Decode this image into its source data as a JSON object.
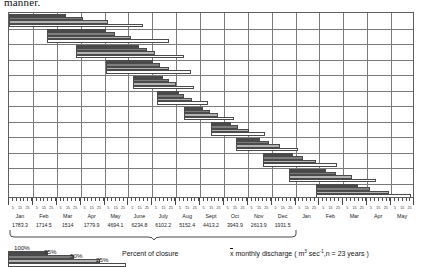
{
  "page": {
    "cut_off_text": "manner."
  },
  "chart_data": {
    "type": "bar",
    "title": "",
    "xlabel": "",
    "ylabel": "",
    "orientation": "horizontal",
    "grid": true,
    "legend_position": "bottom-left",
    "x_axis": {
      "tick_days": [
        5,
        15,
        25
      ],
      "months": [
        "Jan",
        "Feb",
        "Mar",
        "Apr",
        "May",
        "June",
        "July",
        "Aug",
        "Sept",
        "Oct",
        "Nov",
        "Dec",
        "Jan",
        "Feb",
        "Mar",
        "Apr",
        "May"
      ],
      "monthly_discharge": [
        "1783.3",
        "1714.5",
        "1514",
        "1779.9",
        "4694.1",
        "6234.8",
        "6102.2",
        "5152.4",
        "4413.2",
        "3943.9",
        "2613.9",
        "1931.5",
        "",
        "",
        "",
        "",
        ""
      ]
    },
    "series": [
      {
        "name": "100%",
        "shade": "#4a4a4a"
      },
      {
        "name": "75%",
        "shade": "#7d7d7d"
      },
      {
        "name": "50%",
        "shade": "#b3b3b3"
      },
      {
        "name": "25%",
        "shade": "#fdfdfd"
      }
    ],
    "groups": [
      {
        "label": "Jan",
        "start_month": 0,
        "bars": [
          {
            "series": "100%",
            "start": 0.0,
            "end": 0.14
          },
          {
            "series": "75%",
            "start": 0.0,
            "end": 0.182
          },
          {
            "series": "50%",
            "start": 0.0,
            "end": 0.245
          },
          {
            "series": "25%",
            "start": 0.0,
            "end": 0.33
          }
        ]
      },
      {
        "label": "Feb",
        "start_month": 1,
        "bars": [
          {
            "series": "100%",
            "start": 0.094,
            "end": 0.238
          },
          {
            "series": "75%",
            "start": 0.094,
            "end": 0.262
          },
          {
            "series": "50%",
            "start": 0.094,
            "end": 0.3
          },
          {
            "series": "25%",
            "start": 0.094,
            "end": 0.393
          }
        ]
      },
      {
        "label": "Mar",
        "start_month": 2,
        "bars": [
          {
            "series": "100%",
            "start": 0.166,
            "end": 0.32
          },
          {
            "series": "75%",
            "start": 0.166,
            "end": 0.34
          },
          {
            "series": "50%",
            "start": 0.166,
            "end": 0.36
          },
          {
            "series": "25%",
            "start": 0.166,
            "end": 0.43
          }
        ]
      },
      {
        "label": "Apr",
        "start_month": 3,
        "bars": [
          {
            "series": "100%",
            "start": 0.238,
            "end": 0.355
          },
          {
            "series": "75%",
            "start": 0.238,
            "end": 0.371
          },
          {
            "series": "50%",
            "start": 0.238,
            "end": 0.394
          },
          {
            "series": "25%",
            "start": 0.238,
            "end": 0.448
          }
        ]
      },
      {
        "label": "May",
        "start_month": 4,
        "bars": [
          {
            "series": "100%",
            "start": 0.305,
            "end": 0.38
          },
          {
            "series": "75%",
            "start": 0.305,
            "end": 0.394
          },
          {
            "series": "50%",
            "start": 0.305,
            "end": 0.412
          },
          {
            "series": "25%",
            "start": 0.305,
            "end": 0.455
          }
        ]
      },
      {
        "label": "June",
        "start_month": 5,
        "bars": [
          {
            "series": "100%",
            "start": 0.365,
            "end": 0.418
          },
          {
            "series": "75%",
            "start": 0.365,
            "end": 0.432
          },
          {
            "series": "50%",
            "start": 0.365,
            "end": 0.45
          },
          {
            "series": "25%",
            "start": 0.365,
            "end": 0.489
          }
        ]
      },
      {
        "label": "July",
        "start_month": 6,
        "bars": [
          {
            "series": "100%",
            "start": 0.432,
            "end": 0.477
          },
          {
            "series": "75%",
            "start": 0.432,
            "end": 0.495
          },
          {
            "series": "50%",
            "start": 0.432,
            "end": 0.515
          },
          {
            "series": "25%",
            "start": 0.432,
            "end": 0.553
          }
        ]
      },
      {
        "label": "Aug",
        "start_month": 7,
        "bars": [
          {
            "series": "100%",
            "start": 0.497,
            "end": 0.547
          },
          {
            "series": "75%",
            "start": 0.497,
            "end": 0.565
          },
          {
            "series": "50%",
            "start": 0.497,
            "end": 0.59
          },
          {
            "series": "25%",
            "start": 0.497,
            "end": 0.63
          }
        ]
      },
      {
        "label": "Sept",
        "start_month": 8,
        "bars": [
          {
            "series": "100%",
            "start": 0.56,
            "end": 0.618
          },
          {
            "series": "75%",
            "start": 0.56,
            "end": 0.64
          },
          {
            "series": "50%",
            "start": 0.56,
            "end": 0.668
          },
          {
            "series": "25%",
            "start": 0.56,
            "end": 0.712
          }
        ]
      },
      {
        "label": "Oct",
        "start_month": 9,
        "bars": [
          {
            "series": "100%",
            "start": 0.625,
            "end": 0.7
          },
          {
            "series": "75%",
            "start": 0.625,
            "end": 0.723
          },
          {
            "series": "50%",
            "start": 0.625,
            "end": 0.755
          },
          {
            "series": "25%",
            "start": 0.625,
            "end": 0.808
          }
        ]
      },
      {
        "label": "Nov",
        "start_month": 10,
        "bars": [
          {
            "series": "100%",
            "start": 0.69,
            "end": 0.78
          },
          {
            "series": "75%",
            "start": 0.69,
            "end": 0.805
          },
          {
            "series": "50%",
            "start": 0.69,
            "end": 0.845
          },
          {
            "series": "25%",
            "start": 0.69,
            "end": 0.903
          }
        ]
      },
      {
        "label": "Dec",
        "start_month": 11,
        "bars": [
          {
            "series": "100%",
            "start": 0.757,
            "end": 0.86
          },
          {
            "series": "75%",
            "start": 0.757,
            "end": 0.89
          },
          {
            "series": "50%",
            "start": 0.757,
            "end": 0.935
          },
          {
            "series": "25%",
            "start": 0.757,
            "end": 0.99
          }
        ]
      }
    ]
  },
  "legend": {
    "items": [
      {
        "label": "100%",
        "series": "100%"
      },
      {
        "label": "75%",
        "series": "75%"
      },
      {
        "label": "50%",
        "series": "50%"
      },
      {
        "label": "25%",
        "series": "25%"
      }
    ],
    "closure_caption": "Percent of closure",
    "discharge_caption_prefix": "x",
    "discharge_caption_main": " monthly discharge ( m",
    "discharge_caption_sup1": "3",
    "discharge_caption_mid": " sec",
    "discharge_caption_sup2": "-1",
    "discharge_caption_end": ",n = 23 years )"
  }
}
